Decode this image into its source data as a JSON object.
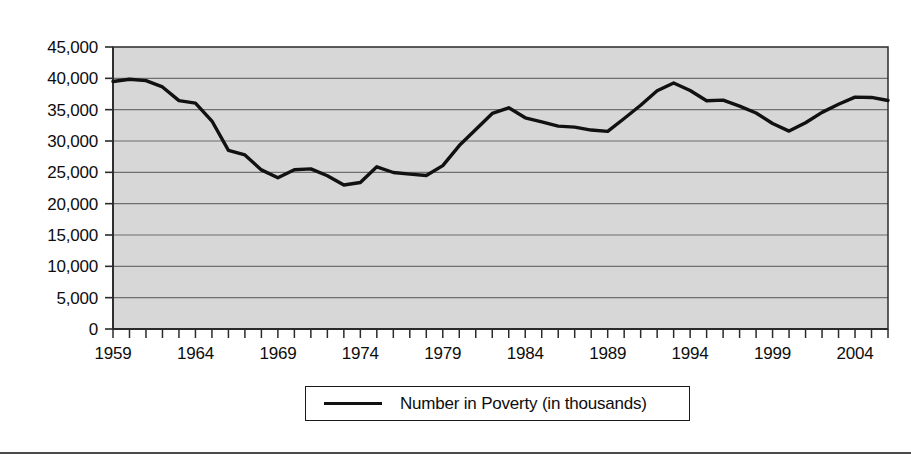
{
  "chart_data": {
    "type": "line",
    "title": "",
    "subtitle": "",
    "xlabel": "",
    "ylabel": "",
    "grid": true,
    "grid_axis": "y",
    "legend_position": "bottom",
    "xlim": [
      1959,
      2006
    ],
    "ylim": [
      0,
      45000
    ],
    "y_tick_labels": [
      "45,000",
      "40,000",
      "35,000",
      "30,000",
      "25,000",
      "20,000",
      "15,000",
      "10,000",
      "5,000",
      "0"
    ],
    "y_tick_values": [
      45000,
      40000,
      35000,
      30000,
      25000,
      20000,
      15000,
      10000,
      5000,
      0
    ],
    "x_tick_labels": [
      "1959",
      "1964",
      "1969",
      "1974",
      "1979",
      "1984",
      "1989",
      "1994",
      "1999",
      "2004"
    ],
    "x_tick_values": [
      1959,
      1964,
      1969,
      1974,
      1979,
      1984,
      1989,
      1994,
      1999,
      2004
    ],
    "x_minor_tick_interval": 1,
    "series": [
      {
        "name": "Number in Poverty (in thousands)",
        "color": "#111111",
        "x": [
          1959,
          1960,
          1961,
          1962,
          1963,
          1964,
          1965,
          1966,
          1967,
          1968,
          1969,
          1970,
          1971,
          1972,
          1973,
          1974,
          1975,
          1976,
          1977,
          1978,
          1979,
          1980,
          1981,
          1982,
          1983,
          1984,
          1985,
          1986,
          1987,
          1988,
          1989,
          1990,
          1991,
          1992,
          1993,
          1994,
          1995,
          1996,
          1997,
          1998,
          1999,
          2000,
          2001,
          2002,
          2003,
          2004,
          2005,
          2006
        ],
        "values": [
          39490,
          39851,
          39628,
          38625,
          36436,
          36055,
          33185,
          28510,
          27769,
          25389,
          24147,
          25420,
          25559,
          24460,
          22973,
          23370,
          25877,
          24975,
          24720,
          24497,
          26072,
          29272,
          31822,
          34398,
          35303,
          33700,
          33064,
          32370,
          32221,
          31745,
          31528,
          33585,
          35708,
          38014,
          39265,
          38059,
          36425,
          36529,
          35574,
          34476,
          32791,
          31581,
          32907,
          34570,
          35861,
          36997,
          36950,
          36460
        ]
      }
    ]
  },
  "legend": {
    "entries": [
      {
        "label": "Number in Poverty (in thousands)",
        "marker": "line-swatch"
      }
    ]
  },
  "plot_style": {
    "plot_background": "#d7d7d7",
    "gridline_color": "#6f6f6f",
    "axis_color": "#2b2b2b",
    "line_color": "#111111",
    "page_background": "#ffffff"
  }
}
